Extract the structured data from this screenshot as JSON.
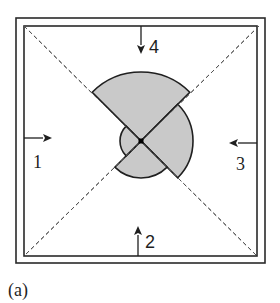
{
  "figure": {
    "caption": "(a)",
    "frame": {
      "outer": {
        "x": 16,
        "y": 18,
        "w": 249,
        "h": 245
      },
      "inner": {
        "x": 24,
        "y": 26,
        "w": 233,
        "h": 230
      }
    },
    "center": {
      "x": 141,
      "y": 141
    },
    "diagonals": [
      {
        "x1": 24,
        "y1": 26,
        "x2": 257,
        "y2": 256
      },
      {
        "x1": 259,
        "y1": 26,
        "x2": 24,
        "y2": 256
      }
    ],
    "wedges": [
      {
        "direction": "up",
        "radius": 69,
        "start_deg": 45,
        "end_deg": 135,
        "fill": "#c9c9c9"
      },
      {
        "direction": "right",
        "radius": 52,
        "start_deg": -45,
        "end_deg": 45,
        "fill": "#c9c9c9"
      },
      {
        "direction": "down",
        "radius": 37,
        "start_deg": 225,
        "end_deg": 315,
        "fill": "#c9c9c9"
      },
      {
        "direction": "left",
        "radius": 21,
        "start_deg": 135,
        "end_deg": 225,
        "fill": "#c9c9c9"
      }
    ],
    "arrows": [
      {
        "id": "1",
        "label": "1",
        "x1": 24,
        "y1": 138,
        "x2": 52,
        "y2": 138,
        "label_x": 33,
        "label_y": 168,
        "font": "serif"
      },
      {
        "id": "2",
        "label": "2",
        "x1": 138,
        "y1": 256,
        "x2": 138,
        "y2": 226,
        "label_x": 145,
        "label_y": 248,
        "font": "sans"
      },
      {
        "id": "3",
        "label": "3",
        "x1": 257,
        "y1": 143,
        "x2": 229,
        "y2": 143,
        "label_x": 236,
        "label_y": 170,
        "font": "serif"
      },
      {
        "id": "4",
        "label": "4",
        "x1": 141,
        "y1": 26,
        "x2": 141,
        "y2": 54,
        "label_x": 149,
        "label_y": 53,
        "font": "sans"
      }
    ],
    "center_dot": {
      "size": 5,
      "color": "#000000"
    }
  }
}
